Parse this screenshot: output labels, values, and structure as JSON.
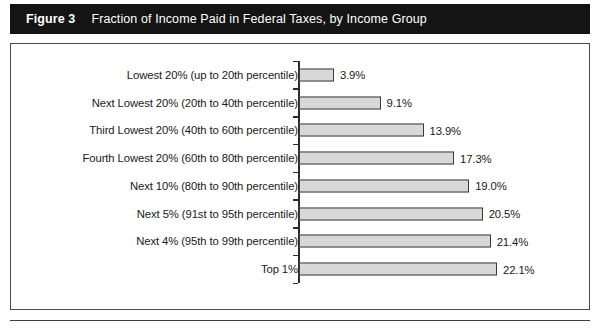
{
  "figure": {
    "number_label": "Figure 3",
    "title": "Fraction of Income Paid in Federal Taxes, by Income Group"
  },
  "colors": {
    "title_bar_bg": "#141414",
    "title_text": "#ffffff",
    "bar_fill": "#d8d8d8",
    "bar_border": "#3a3a3a",
    "axis": "#2b2b2b",
    "frame_border": "#4a4a4a",
    "label_text": "#1a1a1a"
  },
  "chart_data": {
    "type": "bar",
    "orientation": "horizontal",
    "title": "Fraction of Income Paid in Federal Taxes, by Income Group",
    "subtitle": "",
    "xlabel": "",
    "ylabel": "",
    "grid": false,
    "legend": false,
    "xlim": [
      0,
      22.1
    ],
    "categories": [
      "Lowest 20% (up to 20th percentile)",
      "Next Lowest 20% (20th to 40th percentile)",
      "Third Lowest 20% (40th to 60th percentile)",
      "Fourth Lowest 20% (60th to 80th percentile)",
      "Next 10% (80th to 90th percentile)",
      "Next 5% (91st to 95th percentile)",
      "Next 4% (95th to 99th percentile)",
      "Top 1%"
    ],
    "values": [
      3.9,
      9.1,
      13.9,
      17.3,
      19.0,
      20.5,
      21.4,
      22.1
    ],
    "value_labels": [
      "3.9%",
      "9.1%",
      "13.9%",
      "17.3%",
      "19.0%",
      "20.5%",
      "21.4%",
      "22.1%"
    ]
  }
}
